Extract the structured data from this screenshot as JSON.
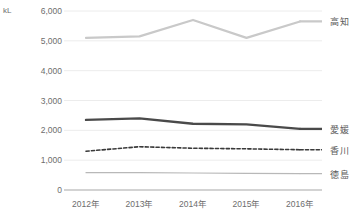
{
  "chart_data": {
    "type": "line",
    "title": "",
    "xlabel": "",
    "ylabel": "kL",
    "unit_label": "kL",
    "categories": [
      "2012年",
      "2013年",
      "2014年",
      "2015年",
      "2016年"
    ],
    "x": [
      2012,
      2013,
      2014,
      2015,
      2016
    ],
    "ylim": [
      0,
      6000
    ],
    "ytick_values": [
      0,
      1000,
      2000,
      3000,
      4000,
      5000,
      6000
    ],
    "ytick_labels": [
      "0",
      "1,000",
      "2,000",
      "3,000",
      "4,000",
      "5,000",
      "6,000"
    ],
    "grid": true,
    "grid_axis": "y",
    "legend_position": "right-inline",
    "series": [
      {
        "name": "高知",
        "values": [
          5100,
          5150,
          5700,
          5100,
          5650
        ],
        "color": "#c9c9c9",
        "style": "solid",
        "width": 2.2
      },
      {
        "name": "愛媛",
        "values": [
          2350,
          2400,
          2220,
          2200,
          2050
        ],
        "color": "#4a4a4a",
        "style": "solid",
        "width": 2.4
      },
      {
        "name": "香川",
        "values": [
          1300,
          1450,
          1400,
          1380,
          1350
        ],
        "color": "#3a3a3a",
        "style": "dashed",
        "width": 1.6
      },
      {
        "name": "徳島",
        "values": [
          580,
          580,
          570,
          560,
          550
        ],
        "color": "#b8b8b8",
        "style": "solid",
        "width": 1.2
      }
    ]
  },
  "axis": {
    "baseline_color": "#c4c4c4",
    "gridline_color": "#ececec"
  }
}
